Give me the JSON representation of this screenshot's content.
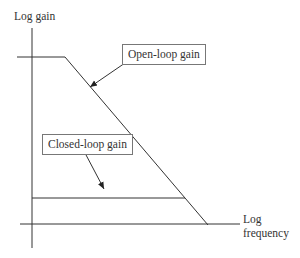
{
  "diagram": {
    "y_axis_label": "Log gain",
    "x_axis_label_line1": "Log",
    "x_axis_label_line2": "frequency",
    "open_loop_label": "Open-loop gain",
    "closed_loop_label": "Closed-loop gain",
    "line_color": "#333333"
  }
}
